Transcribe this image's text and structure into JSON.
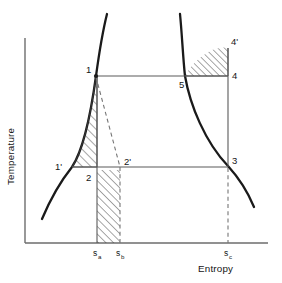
{
  "figure": {
    "type": "t-s-diagram",
    "axes": {
      "x_label": "Entropy",
      "y_label": "Temperature",
      "x_axis_y": 243,
      "y_axis_x": 25,
      "y_axis_top": 38,
      "x_axis_right": 268
    },
    "colors": {
      "axis": "#6d6d6d",
      "dome": "#1a1a1a",
      "cycle": "#5a5a5a",
      "dashed": "#767676",
      "hatch": "#3a3a3a",
      "background": "#ffffff"
    },
    "state_points": [
      {
        "id": "1",
        "label": "1",
        "x": 96,
        "y": 76,
        "label_x": 86,
        "label_y": 73
      },
      {
        "id": "1p",
        "label": "1'",
        "x": 72,
        "y": 167,
        "label_x": 55,
        "label_y": 170
      },
      {
        "id": "2",
        "label": "2",
        "x": 97,
        "y": 170,
        "label_x": 86,
        "label_y": 181
      },
      {
        "id": "2p",
        "label": "2'",
        "x": 120,
        "y": 167,
        "label_x": 124,
        "label_y": 165
      },
      {
        "id": "3",
        "label": "3",
        "x": 228,
        "y": 166,
        "label_x": 232,
        "label_y": 164
      },
      {
        "id": "4",
        "label": "4",
        "x": 228,
        "y": 76,
        "label_x": 232,
        "label_y": 75
      },
      {
        "id": "4p",
        "label": "4'",
        "x": 228,
        "y": 48,
        "label_x": 231,
        "label_y": 45
      },
      {
        "id": "5",
        "label": "5",
        "x": 185,
        "y": 76,
        "label_x": 180,
        "label_y": 88
      }
    ],
    "entropy_ticks": [
      {
        "id": "sa",
        "base": "s",
        "sub": "a",
        "x": 97,
        "label_x": 94,
        "label_y": 255
      },
      {
        "id": "sb",
        "base": "s",
        "sub": "b",
        "x": 120,
        "label_x": 117,
        "label_y": 255
      },
      {
        "id": "sc",
        "base": "s",
        "sub": "c",
        "x": 228,
        "label_x": 225,
        "label_y": 255
      }
    ],
    "hatched_regions": [
      {
        "id": "region-1-1p-2",
        "name": "compression-work-region",
        "hatch_angle": 45
      },
      {
        "id": "region-2-sa-sb",
        "name": "heat-rejection-region",
        "hatch_angle": 45
      },
      {
        "id": "region-4-4p-5",
        "name": "superheat-region",
        "hatch_angle": 45
      }
    ],
    "curves": {
      "saturated_liquid_line": "left branch of the saturation dome, rising from lower-left to upper-right through 1' and 1",
      "saturated_vapor_line": "right branch of the saturation dome, falling from upper-left to lower-right through 5 and 3"
    }
  }
}
